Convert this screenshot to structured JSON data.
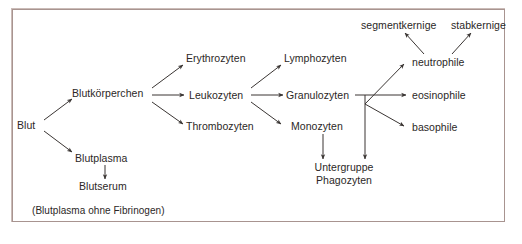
{
  "figure": {
    "frame_border_color": "#a89490",
    "background_color": "#ffffff",
    "text_color": "#2b2726",
    "line_color": "#3a3533"
  },
  "nodes": {
    "blut": "Blut",
    "blutkoerperchen": "Blutkörperchen",
    "blutplasma": "Blutplasma",
    "blutserum": "Blutserum",
    "blutplasma_note": "(Blutplasma ohne Fibrinogen)",
    "erythrozyten": "Erythrozyten",
    "leukozyten": "Leukozyten",
    "thrombozyten": "Thrombozyten",
    "lymphozyten": "Lymphozyten",
    "granulozyten": "Granulozyten",
    "monozyten": "Monozyten",
    "untergruppe_phagozyten_line1": "Untergruppe",
    "untergruppe_phagozyten_line2": "Phagozyten",
    "neutrophile": "neutrophile",
    "eosinophile": "eosinophile",
    "basophile": "basophile",
    "segmentkernige": "segmentkernige",
    "stabkernige": "stabkernige"
  },
  "edges": [
    {
      "from": "blut",
      "to": "blutkoerperchen",
      "style": "arrow-diagonal-up"
    },
    {
      "from": "blut",
      "to": "blutplasma",
      "style": "arrow-diagonal-down"
    },
    {
      "from": "blutplasma",
      "to": "blutserum",
      "style": "arrow-vertical-down"
    },
    {
      "from": "blutkoerperchen",
      "to": "erythrozyten",
      "style": "arrow-diagonal-up"
    },
    {
      "from": "blutkoerperchen",
      "to": "leukozyten",
      "style": "arrow-horizontal"
    },
    {
      "from": "blutkoerperchen",
      "to": "thrombozyten",
      "style": "arrow-diagonal-down"
    },
    {
      "from": "leukozyten",
      "to": "lymphozyten",
      "style": "arrow-diagonal-up"
    },
    {
      "from": "leukozyten",
      "to": "granulozyten",
      "style": "arrow-horizontal"
    },
    {
      "from": "leukozyten",
      "to": "monozyten",
      "style": "arrow-diagonal-down"
    },
    {
      "from": "granulozyten",
      "to": "neutrophile",
      "style": "bracket-diagonal-up"
    },
    {
      "from": "granulozyten",
      "to": "eosinophile",
      "style": "bracket-horizontal"
    },
    {
      "from": "granulozyten",
      "to": "basophile",
      "style": "bracket-diagonal-down"
    },
    {
      "from": "granulozyten",
      "to": "untergruppe_phagozyten",
      "style": "bracket-vertical-down"
    },
    {
      "from": "monozyten",
      "to": "untergruppe_phagozyten",
      "style": "arrow-vertical-down"
    },
    {
      "from": "neutrophile",
      "to": "segmentkernige",
      "style": "arrow-diagonal-up-left"
    },
    {
      "from": "neutrophile",
      "to": "stabkernige",
      "style": "arrow-diagonal-up-right"
    }
  ]
}
